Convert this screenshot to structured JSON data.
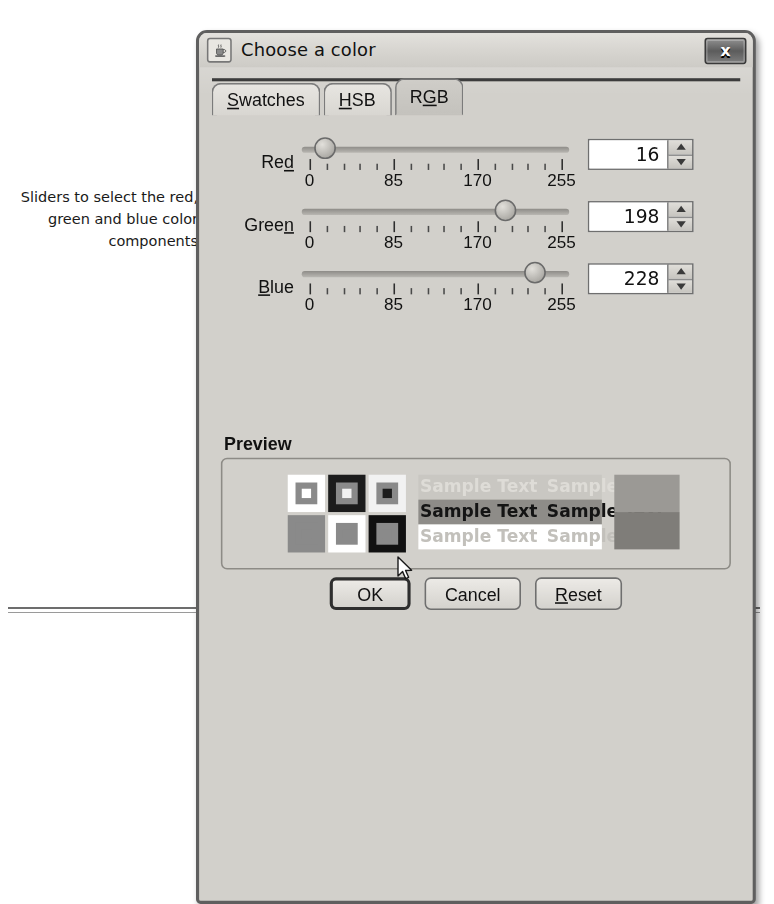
{
  "annotation": {
    "text": "Sliders to select the red, green and blue color components"
  },
  "dialog": {
    "title": "Choose a color",
    "title_icon": "java-coffee-cup-icon",
    "close_label": "x",
    "tabs": [
      {
        "label": "Swatches",
        "mnemonic": "S",
        "active": false
      },
      {
        "label": "HSB",
        "mnemonic": "H",
        "active": false
      },
      {
        "label": "RGB",
        "mnemonic": "G",
        "active": true
      }
    ],
    "sliders": [
      {
        "label": "Red",
        "mnemonic": "d",
        "value": 16,
        "min": 0,
        "max": 255,
        "tick_labels": [
          "0",
          "85",
          "170",
          "255"
        ],
        "tick_values": [
          0,
          85,
          170,
          255
        ]
      },
      {
        "label": "Green",
        "mnemonic": "n",
        "value": 198,
        "min": 0,
        "max": 255,
        "tick_labels": [
          "0",
          "85",
          "170",
          "255"
        ],
        "tick_values": [
          0,
          85,
          170,
          255
        ]
      },
      {
        "label": "Blue",
        "mnemonic": "B",
        "value": 228,
        "min": 0,
        "max": 255,
        "tick_labels": [
          "0",
          "85",
          "170",
          "255"
        ],
        "tick_values": [
          0,
          85,
          170,
          255
        ]
      }
    ],
    "preview": {
      "title": "Preview",
      "sample_text": "Sample Text",
      "selected_color": "#7d7d7d",
      "swatches": [
        {
          "outer": "#ffffff",
          "mid": "#8a8a8a",
          "inner": "#ffffff"
        },
        {
          "outer": "#1c1c1c",
          "mid": "#8a8a8a",
          "inner": "#f2f2f2"
        },
        {
          "outer": "#f2f2f2",
          "mid": "#8a8a8a",
          "inner": "#1c1c1c"
        },
        {
          "outer": "#8a8a8a",
          "mid": "#8a8a8a",
          "inner": "#8a8a8a"
        },
        {
          "outer": "#ffffff",
          "mid": "#8a8a8a",
          "inner": "#8a8a8a"
        },
        {
          "outer": "#111111",
          "mid": "#8a8a8a",
          "inner": "#8a8a8a"
        }
      ],
      "sample_rows": [
        {
          "bg": "#c9c7c2",
          "fg": "#dedcd7"
        },
        {
          "bg": "#8e8c88",
          "fg": "#141414"
        },
        {
          "bg": "#ffffff",
          "fg": "#c2c0bb"
        }
      ],
      "blocks": [
        "#9b9995",
        "#7f7d79"
      ]
    },
    "buttons": [
      {
        "label": "OK",
        "mnemonic": "",
        "default": true
      },
      {
        "label": "Cancel",
        "mnemonic": "",
        "default": false
      },
      {
        "label": "Reset",
        "mnemonic": "R",
        "default": false
      }
    ]
  }
}
